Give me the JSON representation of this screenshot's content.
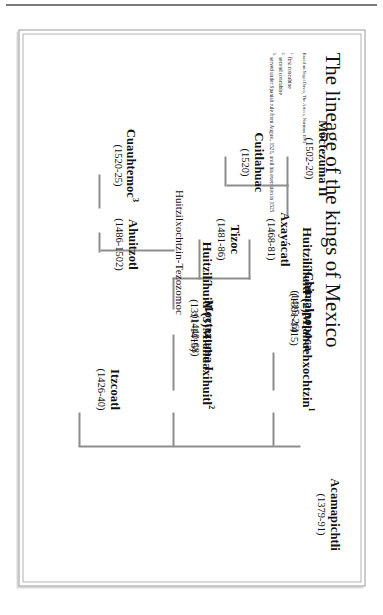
{
  "figure": {
    "title": "The lineage of the kings of Mexico",
    "source_note": "Based on Nigel Davis, The Aztecs, Norman 1973",
    "footnotes": [
      {
        "marker": "1.",
        "text": "first concubine"
      },
      {
        "marker": "2.",
        "text": "second concubine"
      },
      {
        "marker": "3.",
        "text": "served under Spanish rule from August, 1521, until his execution in 1525"
      }
    ],
    "nodes": [
      {
        "id": "acamapichtli",
        "name": "Acamapichtli",
        "dates": "(1379-91)"
      },
      {
        "id": "huitzilihuitl2",
        "name": "Huitzilíhuitl-(2)Miahuehxochtzin",
        "sup": "1",
        "dates": "(1391-1415)"
      },
      {
        "id": "huitzilihuitl3",
        "name": "Huitzilíhuitl-(3)Miahuaxihuitl",
        "sup": "2",
        "dates": "(1391-1415)"
      },
      {
        "id": "itzcoatl",
        "name": "Itzcoatl",
        "dates": "(1426-40)"
      },
      {
        "id": "chimalpopoca",
        "name": "Chimalpopoca",
        "dates": "(1415-26)"
      },
      {
        "id": "moctezuma1",
        "name": "Moctezuma I",
        "dates": "(1440-68)"
      },
      {
        "id": "huitzilxochtzin",
        "name": "Huitzilxochtzin-Tezozomoc",
        "dates": ""
      },
      {
        "id": "axayacatl",
        "name": "Axayácatl",
        "dates": "(1468-81)"
      },
      {
        "id": "tizoc",
        "name": "Tizoc",
        "dates": "(1481-86)"
      },
      {
        "id": "ahuitzotl",
        "name": "Ahuitzotl",
        "dates": "(1486-1502)"
      },
      {
        "id": "moctezuma2",
        "name": "Moctezuma II",
        "dates": "(1502-20)"
      },
      {
        "id": "cuitlahuac",
        "name": "Cuitlahuac",
        "dates": "(1520)"
      },
      {
        "id": "cuauhtemoc",
        "name": "Cuauhtemoc",
        "sup": "3",
        "dates": "(1520-25)"
      }
    ],
    "colors": {
      "line": "#8d8d8d",
      "text": "#111111",
      "frame": "#9a9a9a",
      "rule": "#7b7b7b"
    }
  }
}
